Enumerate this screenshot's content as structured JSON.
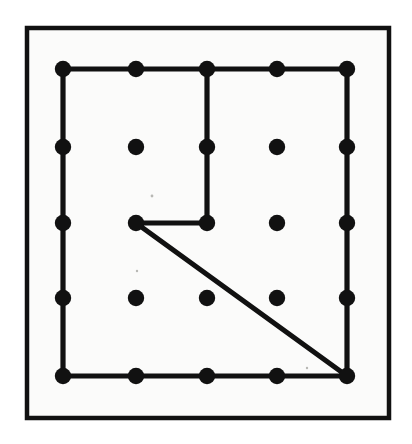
{
  "figure": {
    "title": "Geoboard polygon figure",
    "description": "A 5 by 5 array of round pegs inside a square frame, with a rubber-band polygon stretched around some of the pegs.",
    "background_color": "#fbfbfa",
    "page_background_color": "#ffffff",
    "ink_color": "#111111"
  },
  "frame": {
    "name": "board-frame",
    "x": 27,
    "y": 28,
    "width": 362,
    "height": 390,
    "stroke_width": 4.5
  },
  "grid": {
    "rows": 5,
    "columns": 5,
    "peg_radius": 8.2,
    "column_x": [
      63,
      136,
      207,
      277,
      347
    ],
    "row_y": [
      69,
      147,
      223,
      298,
      376
    ],
    "column_spacing": 71,
    "row_spacing": 76.75
  },
  "pegs": [
    {
      "name": "peg-r1c1",
      "row": 1,
      "col": 1,
      "cx": 63,
      "cy": 69,
      "on_band": true
    },
    {
      "name": "peg-r1c2",
      "row": 1,
      "col": 2,
      "cx": 136,
      "cy": 69,
      "on_band": true
    },
    {
      "name": "peg-r1c3",
      "row": 1,
      "col": 3,
      "cx": 207,
      "cy": 69,
      "on_band": true
    },
    {
      "name": "peg-r1c4",
      "row": 1,
      "col": 4,
      "cx": 277,
      "cy": 69,
      "on_band": true
    },
    {
      "name": "peg-r1c5",
      "row": 1,
      "col": 5,
      "cx": 347,
      "cy": 69,
      "on_band": true
    },
    {
      "name": "peg-r2c1",
      "row": 2,
      "col": 1,
      "cx": 63,
      "cy": 147,
      "on_band": true
    },
    {
      "name": "peg-r2c2",
      "row": 2,
      "col": 2,
      "cx": 136,
      "cy": 147,
      "on_band": false
    },
    {
      "name": "peg-r2c3",
      "row": 2,
      "col": 3,
      "cx": 207,
      "cy": 147,
      "on_band": true
    },
    {
      "name": "peg-r2c4",
      "row": 2,
      "col": 4,
      "cx": 277,
      "cy": 147,
      "on_band": false
    },
    {
      "name": "peg-r2c5",
      "row": 2,
      "col": 5,
      "cx": 347,
      "cy": 147,
      "on_band": true
    },
    {
      "name": "peg-r3c1",
      "row": 3,
      "col": 1,
      "cx": 63,
      "cy": 223,
      "on_band": true
    },
    {
      "name": "peg-r3c2",
      "row": 3,
      "col": 2,
      "cx": 136,
      "cy": 223,
      "on_band": true
    },
    {
      "name": "peg-r3c3",
      "row": 3,
      "col": 3,
      "cx": 207,
      "cy": 223,
      "on_band": true
    },
    {
      "name": "peg-r3c4",
      "row": 3,
      "col": 4,
      "cx": 277,
      "cy": 223,
      "on_band": false
    },
    {
      "name": "peg-r3c5",
      "row": 3,
      "col": 5,
      "cx": 347,
      "cy": 223,
      "on_band": true
    },
    {
      "name": "peg-r4c1",
      "row": 4,
      "col": 1,
      "cx": 63,
      "cy": 298,
      "on_band": true
    },
    {
      "name": "peg-r4c2",
      "row": 4,
      "col": 2,
      "cx": 136,
      "cy": 298,
      "on_band": false
    },
    {
      "name": "peg-r4c3",
      "row": 4,
      "col": 3,
      "cx": 207,
      "cy": 298,
      "on_band": false
    },
    {
      "name": "peg-r4c4",
      "row": 4,
      "col": 4,
      "cx": 277,
      "cy": 298,
      "on_band": false
    },
    {
      "name": "peg-r4c5",
      "row": 4,
      "col": 5,
      "cx": 347,
      "cy": 298,
      "on_band": true
    },
    {
      "name": "peg-r5c1",
      "row": 5,
      "col": 1,
      "cx": 63,
      "cy": 376,
      "on_band": true
    },
    {
      "name": "peg-r5c2",
      "row": 5,
      "col": 2,
      "cx": 136,
      "cy": 376,
      "on_band": true
    },
    {
      "name": "peg-r5c3",
      "row": 5,
      "col": 3,
      "cx": 207,
      "cy": 376,
      "on_band": true
    },
    {
      "name": "peg-r5c4",
      "row": 5,
      "col": 4,
      "cx": 277,
      "cy": 376,
      "on_band": true
    },
    {
      "name": "peg-r5c5",
      "row": 5,
      "col": 5,
      "cx": 347,
      "cy": 376,
      "on_band": true
    }
  ],
  "band": {
    "name": "rubber-band-polygon",
    "closed": true,
    "vertices": [
      {
        "label": "r1c1",
        "x": 63,
        "y": 69
      },
      {
        "label": "r1c5",
        "x": 347,
        "y": 69
      },
      {
        "label": "r5c5",
        "x": 347,
        "y": 376
      },
      {
        "label": "r5c1",
        "x": 63,
        "y": 376
      }
    ],
    "outline_path": "M 63 69 L 347 69 L 347 376 L 63 376 Z",
    "notch_path": "M 207 69 L 207 223 L 136 223 L 347 376",
    "notch_vertices": [
      {
        "label": "r1c3",
        "x": 207,
        "y": 69
      },
      {
        "label": "r3c3",
        "x": 207,
        "y": 223
      },
      {
        "label": "r3c2",
        "x": 136,
        "y": 223
      },
      {
        "label": "r5c5",
        "x": 347,
        "y": 376
      }
    ],
    "stroke_width": 5.2
  },
  "specks": [
    {
      "name": "speck-1",
      "cx": 152,
      "cy": 196,
      "r": 1.4
    },
    {
      "name": "speck-2",
      "cx": 137,
      "cy": 271,
      "r": 1.2
    },
    {
      "name": "speck-3",
      "cx": 307,
      "cy": 368,
      "r": 1.2
    }
  ]
}
